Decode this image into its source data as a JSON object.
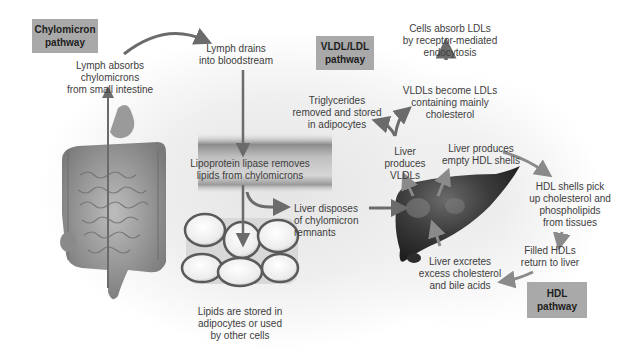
{
  "diagram": {
    "pathways": {
      "chylomicron": "Chylomicron\npathway",
      "vldl_ldl": "VLDL/LDL\npathway",
      "hdl": "HDL\npathway"
    },
    "labels": {
      "lymph_absorbs": "Lymph absorbs\nchylomicrons\nfrom small intestine",
      "lymph_drains": "Lymph drains\ninto bloodstream",
      "lipoprotein_lipase": "Lipoprotein lipase removes\nlipids from chylomicrons",
      "liver_disposes": "Liver disposes\nof chylomicron\nremnants",
      "lipids_stored": "Lipids are stored in\nadipocytes or used\nby other cells",
      "cells_absorb_ldl": "Cells absorb LDLs\nby receptor-mediated\nendocytosis",
      "vldl_become_ldl": "VLDLs become LDLs\ncontaining mainly\ncholesterol",
      "triglycerides_removed": "Triglycerides\nremoved and stored\nin adipocytes",
      "liver_produces_vldl": "Liver\nproduces\nVLDLs",
      "liver_produces_hdl": "Liver produces\nempty HDL shells",
      "hdl_pick_up": "HDL shells pick\nup cholesterol and\nphospholipids\nfrom tissues",
      "filled_hdl": "Filled HDLs\nreturn to liver",
      "liver_excretes": "Liver excretes\nexcess cholesterol\nand bile acids"
    },
    "images": {
      "digestive_tract": "digestive-tract-illustration",
      "blood_vessel": "blood-vessel-cross-section",
      "adipocytes": "adipocyte-cluster",
      "liver": "liver-illustration"
    },
    "colors": {
      "arrow": "#6b6b6b",
      "arrow_light": "#8a8a8a",
      "pathway_box": "#a9a9a9",
      "liver": "#3a3a3a",
      "text": "#3d3d3d"
    }
  }
}
